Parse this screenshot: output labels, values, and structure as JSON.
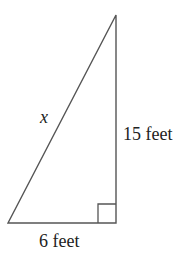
{
  "diagram": {
    "type": "right-triangle",
    "labels": {
      "hypotenuse": "x",
      "vertical_leg": "15 feet",
      "horizontal_leg": "6 feet"
    },
    "right_angle": "bottom-right",
    "stroke_color": "#555555"
  }
}
